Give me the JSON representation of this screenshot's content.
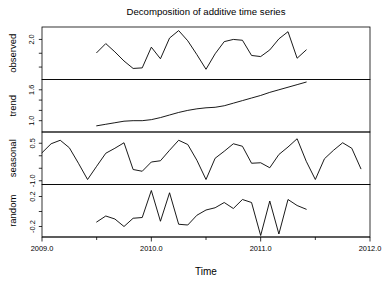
{
  "chart_data": {
    "type": "line",
    "title": "Decomposition of additive time series",
    "xlabel": "Time",
    "ylabel": "",
    "grid": false,
    "legend": "none",
    "line_color": "#000000",
    "background_color": "#ffffff",
    "xlim": [
      2009.0,
      2012.0
    ],
    "x_ticks": [
      2009.0,
      2010.0,
      2011.0,
      2012.0
    ],
    "x_tick_labels": [
      "2009.0",
      "2010.0",
      "2011.0",
      "2012.0"
    ],
    "x_minor_ticks": [
      2009.5,
      2010.5,
      2011.5
    ],
    "panels": [
      {
        "name": "observed",
        "label": "observed",
        "ylim": [
          0.55,
          2.45
        ],
        "y_ticks": [
          1.0,
          1.5,
          2.0
        ],
        "y_tick_labels": [
          "1.0",
          "1.5",
          "2.0"
        ],
        "y_labeled_ticks": [
          2.0
        ],
        "x": [
          2009.5,
          2009.5833,
          2009.6667,
          2009.75,
          2009.8333,
          2009.9167,
          2010.0,
          2010.0833,
          2010.1667,
          2010.25,
          2010.3333,
          2010.4167,
          2010.5,
          2010.5833,
          2010.6667,
          2010.75,
          2010.8333,
          2010.9167,
          2011.0,
          2011.0833,
          2011.1667,
          2011.25,
          2011.3333,
          2011.4167
        ],
        "values": [
          1.52,
          1.85,
          1.55,
          1.22,
          0.95,
          0.97,
          1.72,
          1.3,
          2.05,
          2.32,
          1.95,
          1.45,
          0.92,
          1.48,
          1.92,
          2.0,
          1.97,
          1.42,
          1.38,
          1.62,
          2.02,
          2.28,
          1.32,
          1.62
        ]
      },
      {
        "name": "trend",
        "label": "trend",
        "ylim": [
          0.78,
          1.8
        ],
        "y_ticks": [
          1.0,
          1.2,
          1.4,
          1.6
        ],
        "y_tick_labels": [
          "1.0",
          "1.2",
          "1.4",
          "1.6"
        ],
        "y_labeled_ticks": [
          1.0,
          1.6
        ],
        "x": [
          2009.5,
          2009.5833,
          2009.6667,
          2009.75,
          2009.8333,
          2009.9167,
          2010.0,
          2010.0833,
          2010.1667,
          2010.25,
          2010.3333,
          2010.4167,
          2010.5,
          2010.5833,
          2010.6667,
          2010.75,
          2010.8333,
          2010.9167,
          2011.0,
          2011.0833,
          2011.1667,
          2011.25,
          2011.3333,
          2011.4167
        ],
        "values": [
          0.9,
          0.93,
          0.96,
          0.99,
          1.0,
          1.0,
          1.02,
          1.06,
          1.11,
          1.16,
          1.2,
          1.23,
          1.25,
          1.26,
          1.29,
          1.34,
          1.39,
          1.44,
          1.49,
          1.55,
          1.6,
          1.65,
          1.7,
          1.75
        ]
      },
      {
        "name": "seasonal",
        "label": "seasonal",
        "ylim": [
          -1.15,
          0.95
        ],
        "y_ticks": [
          -1.0,
          -0.5,
          0.0,
          0.5
        ],
        "y_tick_labels": [
          "-1.0",
          "-0.5",
          "0.0",
          "0.5"
        ],
        "y_labeled_ticks": [
          -1.0,
          0.5
        ],
        "x": [
          2009.0,
          2009.0833,
          2009.1667,
          2009.25,
          2009.3333,
          2009.4167,
          2009.5,
          2009.5833,
          2009.6667,
          2009.75,
          2009.8333,
          2009.9167,
          2010.0,
          2010.0833,
          2010.1667,
          2010.25,
          2010.3333,
          2010.4167,
          2010.5,
          2010.5833,
          2010.6667,
          2010.75,
          2010.8333,
          2010.9167,
          2011.0,
          2011.0833,
          2011.1667,
          2011.25,
          2011.3333,
          2011.4167,
          2011.5,
          2011.5833,
          2011.6667,
          2011.75,
          2011.8333,
          2011.9167
        ],
        "values": [
          0.12,
          0.48,
          0.62,
          0.32,
          -0.3,
          -0.95,
          -0.42,
          0.1,
          0.3,
          0.52,
          -0.55,
          -0.62,
          -0.25,
          -0.2,
          0.22,
          0.62,
          0.45,
          -0.18,
          -0.95,
          -0.1,
          0.18,
          0.48,
          0.38,
          -0.3,
          -0.28,
          -0.48,
          0.05,
          0.35,
          0.68,
          -0.22,
          -0.95,
          -0.12,
          0.22,
          0.52,
          0.3,
          -0.52
        ],
        "period": 12
      },
      {
        "name": "random",
        "label": "random",
        "ylim": [
          -0.34,
          0.36
        ],
        "y_ticks": [
          -0.2,
          0.0,
          0.2
        ],
        "y_tick_labels": [
          "-0.2",
          "0.0",
          "0.2"
        ],
        "y_labeled_ticks": [
          -0.2,
          0.2
        ],
        "x": [
          2009.5,
          2009.5833,
          2009.6667,
          2009.75,
          2009.8333,
          2009.9167,
          2010.0,
          2010.0833,
          2010.1667,
          2010.25,
          2010.3333,
          2010.4167,
          2010.5,
          2010.5833,
          2010.6667,
          2010.75,
          2010.8333,
          2010.9167,
          2011.0,
          2011.0833,
          2011.1667,
          2011.25,
          2011.3333,
          2011.4167
        ],
        "values": [
          -0.14,
          -0.06,
          -0.1,
          -0.2,
          -0.09,
          -0.08,
          0.28,
          -0.13,
          0.25,
          -0.17,
          -0.18,
          -0.05,
          0.02,
          0.05,
          0.12,
          0.04,
          0.16,
          0.12,
          -0.32,
          0.14,
          -0.3,
          0.16,
          0.08,
          0.03
        ]
      }
    ]
  }
}
